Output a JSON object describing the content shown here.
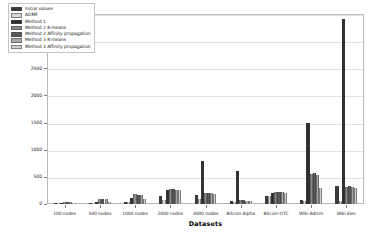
{
  "chart_data": {
    "type": "bar",
    "title": "",
    "xlabel": "Datasets",
    "ylabel": "Sum of Opinions",
    "ylim": [
      0,
      3500
    ],
    "yticks": [
      0,
      500,
      1000,
      1500,
      2000,
      2500,
      3000,
      3500
    ],
    "grid": true,
    "legend_position": "upper left inside",
    "categories": [
      "100 nodes",
      "500 nodes",
      "1000 nodes",
      "2000 nodes",
      "3000 nodes",
      "Bitcoin Alpha",
      "Bitcoin OTC",
      "Wiki Admin",
      "Wiki Elec"
    ],
    "series": [
      {
        "name": "Initial values",
        "color": "#3a3a3a",
        "values": [
          12,
          18,
          30,
          150,
          160,
          60,
          150,
          80,
          330
        ]
      },
      {
        "name": "ADMF",
        "color": "#d8d8d8",
        "values": [
          10,
          14,
          28,
          70,
          90,
          40,
          140,
          60,
          60
        ]
      },
      {
        "name": "Method 1",
        "color": "#2e2e2e",
        "values": [
          22,
          30,
          120,
          250,
          800,
          600,
          200,
          1500,
          3400
        ]
      },
      {
        "name": "Method 2 K-means",
        "color": "#8c8c8c",
        "values": [
          30,
          95,
          180,
          270,
          210,
          70,
          220,
          560,
          320
        ]
      },
      {
        "name": "Method 2 Affinity propagation",
        "color": "#5a5a5a",
        "values": [
          34,
          90,
          175,
          275,
          200,
          65,
          225,
          570,
          325
        ]
      },
      {
        "name": "Method 3 K-means",
        "color": "#a8a8a8",
        "values": [
          30,
          85,
          165,
          265,
          195,
          60,
          215,
          540,
          315
        ]
      },
      {
        "name": "Method 3 Affinity propagation",
        "color": "#cfcfcf",
        "values": [
          20,
          40,
          90,
          250,
          180,
          55,
          205,
          300,
          300
        ]
      }
    ]
  }
}
